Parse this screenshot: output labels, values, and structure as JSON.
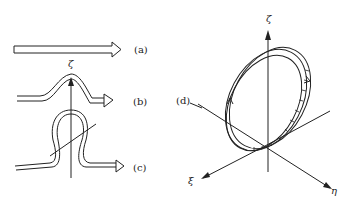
{
  "panels": {
    "a": {
      "label": "(a)"
    },
    "b": {
      "label": "(b)"
    },
    "c": {
      "label": "(c)"
    },
    "d": {
      "label": "(d)"
    }
  },
  "axes": {
    "left_vertical": "ζ",
    "right_vertical": "ζ",
    "right_x": "ξ",
    "right_y": "η"
  },
  "colors": {
    "line": "#222222",
    "background": "#ffffff"
  }
}
